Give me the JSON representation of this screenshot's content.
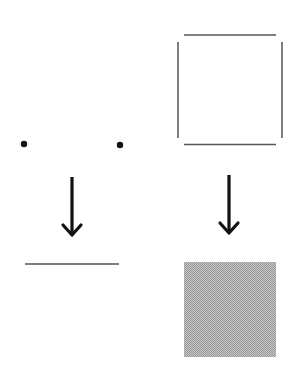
{
  "diagram": {
    "description": "Two transformations: two points become a line segment; four edge segments become a filled square",
    "colors": {
      "background": "#ffffff",
      "ink": "#111111",
      "edge": "#555555",
      "fill": "#b3b3b3"
    },
    "left_panel": {
      "input": {
        "type": "points",
        "points": [
          {
            "label": "point-a",
            "x": 24,
            "y": 144
          },
          {
            "label": "point-b",
            "x": 120,
            "y": 145
          }
        ]
      },
      "arrow": {
        "direction": "down",
        "icon": "arrow-down-icon"
      },
      "output": {
        "type": "line-segment",
        "label": "line",
        "x1": 25,
        "y1": 264,
        "x2": 119,
        "y2": 264
      }
    },
    "right_panel": {
      "input": {
        "type": "open-square-edges",
        "edges": [
          {
            "side": "top",
            "x1": 184,
            "y1": 35,
            "x2": 276,
            "y2": 35
          },
          {
            "side": "bottom",
            "x1": 184,
            "y1": 144,
            "x2": 276,
            "y2": 144
          },
          {
            "side": "left",
            "x1": 178,
            "y1": 42,
            "x2": 178,
            "y2": 138
          },
          {
            "side": "right",
            "x1": 282,
            "y1": 42,
            "x2": 282,
            "y2": 138
          }
        ]
      },
      "arrow": {
        "direction": "down",
        "icon": "arrow-down-icon"
      },
      "output": {
        "type": "filled-square",
        "label": "filled square",
        "x": 184,
        "y": 262,
        "width": 92,
        "height": 95
      }
    }
  }
}
